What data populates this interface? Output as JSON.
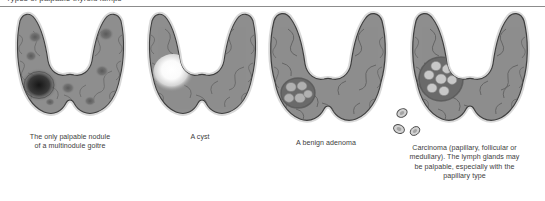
{
  "header": {
    "clipped_heading": "Types of palpable thyroid lumps",
    "divider_color": "#8c8c8c"
  },
  "figure": {
    "background": "#ffffff",
    "gland_fill": "#8e8e8e",
    "gland_outline": "#3f3f3f",
    "septa_color": "#5e5e5e",
    "panels": [
      {
        "id": "multinodular-goitre",
        "caption_line_1": "The only palpable nodule",
        "caption_line_2": "of a multinodule goitre",
        "lesion_type": "multiple-nodules",
        "lesion_description": "One large dark dominant nodule on the left lobe plus several smaller faint nodules scattered through both lobes",
        "dominant_nodule_color": "#2e2e2e",
        "small_nodule_color": "#6e6e6e"
      },
      {
        "id": "cyst",
        "caption_line_1": "A cyst",
        "caption_line_2": "",
        "lesion_type": "cyst",
        "lesion_description": "A single bright, glowing, well-defined round cyst on the left lobe",
        "cyst_color": "#ffffff"
      },
      {
        "id": "benign-adenoma",
        "caption_line_1": "A benign adenoma",
        "caption_line_2": "",
        "lesion_type": "adenoma",
        "lesion_description": "A small cluster of five pale lobules ringed by a dark capsule on the left lobe",
        "lobule_color": "#a8a8a8",
        "capsule_color": "#585858"
      },
      {
        "id": "carcinoma",
        "caption_line_1": "Carcinoma (papillary, follicular or",
        "caption_line_2": "medullary). The lymph glands may",
        "caption_line_3": "be palpable, especially with the",
        "caption_line_4": "papillary type",
        "lesion_type": "carcinoma",
        "lesion_description": "A large irregular cluster of pale lobules ringed by a dark capsule on the left lobe, with three separate small lymph nodes lying outside the gland below and to the left",
        "lobule_color": "#c2c2c2",
        "capsule_color": "#585858",
        "lymph_node_count": 3,
        "lymph_node_color": "#d2d2d2"
      }
    ]
  }
}
